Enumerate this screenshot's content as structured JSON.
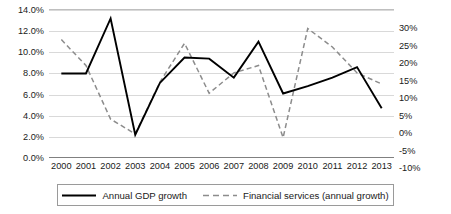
{
  "chart_data": {
    "type": "line",
    "title": "",
    "xlabel": "",
    "ylabel": "",
    "grid": true,
    "legend_position": "bottom",
    "categories": [
      "2000",
      "2001",
      "2002",
      "2003",
      "2004",
      "2005",
      "2006",
      "2007",
      "2008",
      "2009",
      "2010",
      "2011",
      "2012",
      "2013"
    ],
    "axes": {
      "left": {
        "label": "",
        "ylim": [
          0.0,
          14.0
        ],
        "tick_step": 2.0,
        "ticks": [
          "0.0%",
          "2.0%",
          "4.0%",
          "6.0%",
          "8.0%",
          "10.0%",
          "12.0%",
          "14.0%"
        ],
        "tick_values": [
          0.0,
          2.0,
          4.0,
          6.0,
          8.0,
          10.0,
          12.0,
          14.0
        ],
        "series_ref": "Annual GDP growth"
      },
      "right": {
        "label": "",
        "ylim": [
          -10,
          30
        ],
        "tick_step": 5,
        "ticks": [
          "-10%",
          "-5%",
          "0%",
          "5%",
          "10%",
          "15%",
          "20%",
          "25%",
          "30%"
        ],
        "tick_values": [
          -10,
          -5,
          0,
          5,
          10,
          15,
          20,
          25,
          30
        ],
        "series_ref": "Financial services (annual growth)"
      }
    },
    "series": [
      {
        "name": "Annual GDP growth",
        "axis": "left",
        "style": "solid",
        "color": "#000000",
        "values": [
          8.0,
          8.0,
          13.2,
          2.2,
          7.1,
          9.5,
          9.4,
          7.6,
          11.0,
          6.1,
          6.8,
          7.6,
          8.6,
          4.7
        ]
      },
      {
        "name": "Financial services (annual growth)",
        "axis": "right",
        "style": "dashed",
        "color": "#8c8c8c",
        "values": [
          22.0,
          15.0,
          0.5,
          -3.5,
          10.5,
          21.0,
          7.5,
          13.0,
          15.0,
          -4.5,
          25.0,
          20.0,
          13.0,
          10.0
        ]
      }
    ]
  },
  "legend": {
    "entries": [
      {
        "label": "Annual GDP growth",
        "style": "solid"
      },
      {
        "label": "Financial services (annual growth)",
        "style": "dashed"
      }
    ]
  }
}
